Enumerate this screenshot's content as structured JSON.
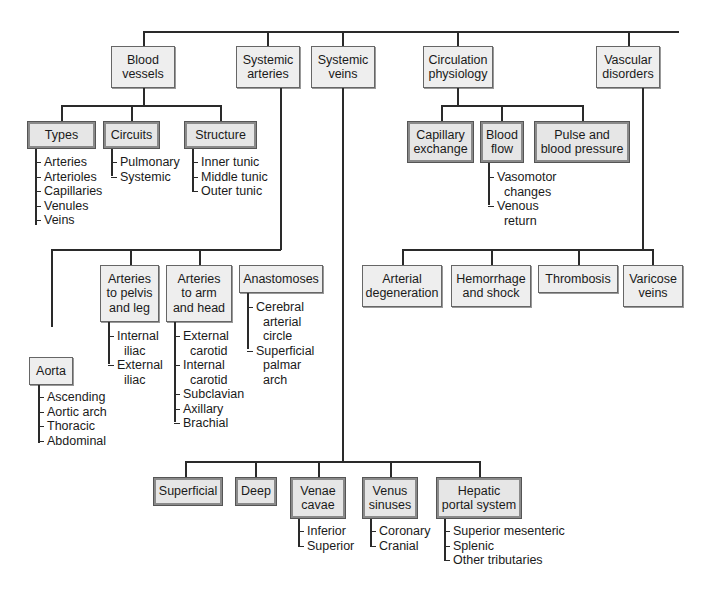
{
  "diagram": {
    "type": "concept-map",
    "root_topics": [
      {
        "id": "blood_vessels",
        "label": "Blood\nvessels"
      },
      {
        "id": "systemic_arteries",
        "label": "Systemic\narteries"
      },
      {
        "id": "systemic_veins",
        "label": "Systemic\nveins"
      },
      {
        "id": "circulation_physiology",
        "label": "Circulation\nphysiology"
      },
      {
        "id": "vascular_disorders",
        "label": "Vascular\ndisorders"
      }
    ],
    "blood_vessels": {
      "types": {
        "label": "Types",
        "items": [
          "Arteries",
          "Arterioles",
          "Capillaries",
          "Venules",
          "Veins"
        ]
      },
      "circuits": {
        "label": "Circuits",
        "items": [
          "Pulmonary",
          "Systemic"
        ]
      },
      "structure": {
        "label": "Structure",
        "items": [
          "Inner tunic",
          "Middle tunic",
          "Outer tunic"
        ]
      }
    },
    "systemic_arteries": {
      "aorta": {
        "label": "Aorta",
        "items": [
          "Ascending",
          "Aortic arch",
          "Thoracic",
          "Abdominal"
        ]
      },
      "pelvis_leg": {
        "label": "Arteries\nto pelvis\nand leg",
        "items": [
          "Internal\n  iliac",
          "External\n  iliac"
        ]
      },
      "arm_head": {
        "label": "Arteries\nto arm\nand head",
        "items": [
          "External\n  carotid",
          "Internal\n  carotid",
          "Subclavian",
          "Axillary",
          "Brachial"
        ]
      },
      "anastomoses": {
        "label": "Anastomoses",
        "items": [
          "Cerebral\n  arterial\n  circle",
          "Superficial\n  palmar\n  arch"
        ]
      }
    },
    "systemic_veins": {
      "superficial": {
        "label": "Superficial"
      },
      "deep": {
        "label": "Deep"
      },
      "venae_cavae": {
        "label": "Venae\ncavae",
        "items": [
          "Inferior",
          "Superior"
        ]
      },
      "venus_sinuses": {
        "label": "Venus\nsinuses",
        "items": [
          "Coronary",
          "Cranial"
        ]
      },
      "hepatic_portal": {
        "label": "Hepatic\nportal system",
        "items": [
          "Superior mesenteric",
          "Splenic",
          "Other tributaries"
        ]
      }
    },
    "circulation_physiology": {
      "capillary_exchange": {
        "label": "Capillary\nexchange"
      },
      "blood_flow": {
        "label": "Blood\nflow",
        "items": [
          "Vasomotor\n  changes",
          "Venous\n  return"
        ]
      },
      "pulse_bp": {
        "label": "Pulse and\nblood pressure"
      }
    },
    "vascular_disorders": {
      "arterial_degeneration": {
        "label": "Arterial\ndegeneration"
      },
      "hemorrhage_shock": {
        "label": "Hemorrhage\nand shock"
      },
      "thrombosis": {
        "label": "Thrombosis"
      },
      "varicose_veins": {
        "label": "Varicose\nveins"
      }
    }
  }
}
